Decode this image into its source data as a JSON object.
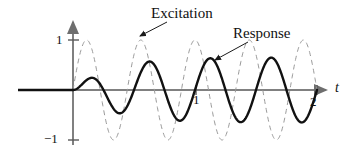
{
  "figure": {
    "name": "excitation-response-beating-plot",
    "background": "#ffffff"
  },
  "axes": {
    "x_axis_name": "t",
    "y_axis_name": "",
    "x_ticks": [
      {
        "value": 1,
        "label": "1"
      },
      {
        "value": 2,
        "label": "2"
      }
    ],
    "y_ticks": [
      {
        "value": 1,
        "label": "1"
      },
      {
        "value": -1,
        "label": "−1"
      }
    ],
    "axis_color": "#808080",
    "xlim": [
      -0.12,
      2.2
    ],
    "ylim": [
      -1.35,
      1.35
    ]
  },
  "annotations": {
    "excitation_label": "Excitation",
    "response_label": "Response"
  },
  "chart_data": {
    "type": "line",
    "title": "",
    "xlabel": "t",
    "ylabel": "",
    "xlim": [
      -0.12,
      2.2
    ],
    "ylim": [
      -1.35,
      1.35
    ],
    "grid": false,
    "legend": "callout-annotations",
    "x_ticks": [
      1,
      2
    ],
    "y_ticks": [
      -1,
      1
    ],
    "series": [
      {
        "name": "Excitation",
        "style": "dashed",
        "color": "#9a9a9a",
        "linewidth": 1,
        "description": "Constant-amplitude sinusoid of amplitude 1, frequency 2.25 cycles per unit t, starting at t=0.",
        "amplitude": 1.0,
        "cycles_per_unit_t": 2.25,
        "phase": 0,
        "x": [
          0.0,
          0.05,
          0.1,
          0.15,
          0.2,
          0.25,
          0.3,
          0.35,
          0.4,
          0.45,
          0.5,
          0.55,
          0.6,
          0.65,
          0.7,
          0.75,
          0.8,
          0.85,
          0.9,
          0.95,
          1.0,
          1.05,
          1.1,
          1.15,
          1.2,
          1.25,
          1.3,
          1.35,
          1.4,
          1.45,
          1.5,
          1.55,
          1.6,
          1.65,
          1.7,
          1.75,
          1.8,
          1.85,
          1.9,
          1.95,
          2.0
        ],
        "y": [
          0.0,
          0.63,
          0.98,
          0.88,
          0.36,
          -0.34,
          -0.88,
          -0.99,
          -0.65,
          0.0,
          0.63,
          0.98,
          0.88,
          0.36,
          -0.34,
          -0.88,
          -0.99,
          -0.65,
          0.0,
          0.63,
          0.98,
          0.88,
          0.36,
          -0.34,
          -0.88,
          -0.99,
          -0.65,
          0.0,
          0.63,
          0.98,
          0.88,
          0.36,
          -0.34,
          -0.88,
          -0.99,
          -0.65,
          0.0,
          0.63,
          0.98,
          0.88,
          0.36
        ]
      },
      {
        "name": "Response",
        "style": "solid",
        "color": "#111111",
        "linewidth": 2.4,
        "description": "Sinusoid of frequency 2.0 cycles per unit t whose amplitude grows from 0 and settles near 0.65.",
        "amplitude_start": 0.0,
        "amplitude_settled": 0.65,
        "cycles_per_unit_t": 2.0,
        "phase": 0,
        "x": [
          0.0,
          0.05,
          0.1,
          0.15,
          0.2,
          0.25,
          0.3,
          0.35,
          0.4,
          0.45,
          0.5,
          0.55,
          0.6,
          0.65,
          0.7,
          0.75,
          0.8,
          0.85,
          0.9,
          0.95,
          1.0,
          1.05,
          1.1,
          1.15,
          1.2,
          1.25,
          1.3,
          1.35,
          1.4,
          1.45,
          1.5,
          1.55,
          1.6,
          1.65,
          1.7,
          1.75,
          1.8,
          1.85,
          1.9,
          1.95,
          2.0
        ],
        "y": [
          0.0,
          0.26,
          0.44,
          0.4,
          0.0,
          -0.41,
          -0.57,
          -0.47,
          0.0,
          0.5,
          0.65,
          0.53,
          0.0,
          -0.54,
          -0.65,
          -0.5,
          0.0,
          0.54,
          0.65,
          0.5,
          0.0,
          -0.54,
          -0.65,
          -0.5,
          0.0,
          0.54,
          0.65,
          0.5,
          0.0,
          -0.54,
          -0.65,
          -0.5,
          0.0,
          0.54,
          0.65,
          0.5,
          0.0,
          -0.54,
          -0.65,
          -0.42,
          0.38
        ]
      }
    ]
  }
}
